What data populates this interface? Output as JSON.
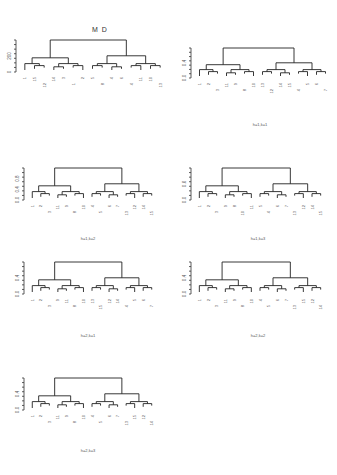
{
  "figure": {
    "title": "M D",
    "layout": "4x2 grid (7 panels)"
  },
  "chart_data": [
    {
      "type": "dendrogram",
      "panel": "MD",
      "title": "M D",
      "caption": "",
      "yticks": [
        "0",
        "200"
      ],
      "leaf_labels": [
        "1",
        "15",
        "12",
        "14",
        "3",
        "1",
        "2",
        "5",
        "8",
        "4",
        "6",
        "4",
        "11",
        "10",
        "13"
      ],
      "box": {
        "x": 20,
        "y": 40,
        "w": 145,
        "h": 32
      }
    },
    {
      "type": "dendrogram",
      "panel": "h=1,k=1",
      "title": "",
      "caption": "h=1,k=1",
      "yticks": [
        "0.0",
        "0.4"
      ],
      "leaf_labels": [
        "1",
        "2",
        "3",
        "11",
        "9",
        "8",
        "10",
        "13",
        "12",
        "14",
        "15",
        "4",
        "5",
        "6",
        "7"
      ],
      "box": {
        "x": 195,
        "y": 48,
        "w": 135,
        "h": 30
      }
    },
    {
      "type": "dendrogram",
      "panel": "h=1,k=2",
      "title": "",
      "caption": "h=1,k=2",
      "yticks": [
        "0.0",
        "0.4",
        "0.8"
      ],
      "leaf_labels": [
        "1",
        "2",
        "3",
        "11",
        "9",
        "8",
        "10",
        "4",
        "5",
        "6",
        "7",
        "13",
        "12",
        "14",
        "15"
      ],
      "box": {
        "x": 28,
        "y": 168,
        "w": 128,
        "h": 32
      }
    },
    {
      "type": "dendrogram",
      "panel": "h=1,k=3",
      "title": "",
      "caption": "h=1,k=3",
      "yticks": [
        "0.0",
        "0.6"
      ],
      "leaf_labels": [
        "1",
        "2",
        "3",
        "9",
        "8",
        "10",
        "11",
        "5",
        "4",
        "6",
        "7",
        "13",
        "12",
        "14",
        "15"
      ],
      "box": {
        "x": 195,
        "y": 168,
        "w": 130,
        "h": 32
      }
    },
    {
      "type": "dendrogram",
      "panel": "h=2,k=1",
      "title": "",
      "caption": "h=2,k=1",
      "yticks": [
        "0.0",
        "0.4"
      ],
      "leaf_labels": [
        "1",
        "2",
        "3",
        "9",
        "11",
        "8",
        "10",
        "13",
        "15",
        "12",
        "14",
        "4",
        "5",
        "6",
        "7"
      ],
      "box": {
        "x": 28,
        "y": 262,
        "w": 128,
        "h": 32
      }
    },
    {
      "type": "dendrogram",
      "panel": "h=2,k=2",
      "title": "",
      "caption": "h=2,k=2",
      "yticks": [
        "0.0",
        "0.4"
      ],
      "leaf_labels": [
        "1",
        "2",
        "3",
        "11",
        "9",
        "8",
        "10",
        "4",
        "5",
        "6",
        "7",
        "13",
        "15",
        "12",
        "14"
      ],
      "box": {
        "x": 195,
        "y": 262,
        "w": 130,
        "h": 32
      }
    },
    {
      "type": "dendrogram",
      "panel": "h=2,k=3",
      "title": "",
      "caption": "h=2,k=3",
      "yticks": [
        "0.0",
        "0.4"
      ],
      "leaf_labels": [
        "1",
        "2",
        "3",
        "11",
        "9",
        "8",
        "10",
        "4",
        "5",
        "6",
        "7",
        "13",
        "15",
        "12",
        "14"
      ],
      "box": {
        "x": 28,
        "y": 378,
        "w": 128,
        "h": 32
      }
    }
  ]
}
